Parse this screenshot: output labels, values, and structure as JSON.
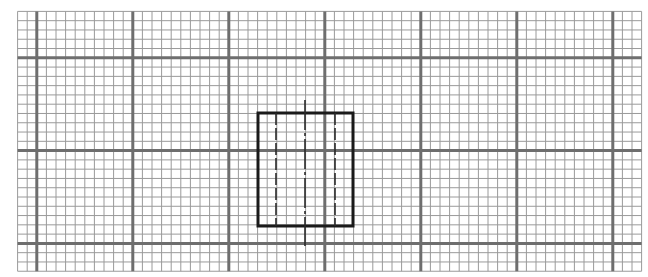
{
  "diagram": {
    "type": "orthographic-view-on-grid-paper",
    "grid": {
      "left": 17.6,
      "top": 11.4,
      "cols": 65,
      "rows": 28,
      "cell_w": 9.6,
      "cell_h": 9.28,
      "major_every_cols": 10,
      "major_col_offset": 2,
      "major_every_rows": 10,
      "major_row_offset": 5,
      "minor_color": "#9a9a9a",
      "major_color": "#6e6e6e",
      "minor_width": 1,
      "major_width": 3
    },
    "shape": {
      "rect": {
        "x": 258,
        "y": 113,
        "w": 95,
        "h": 113,
        "stroke": "#1a1a1a",
        "stroke_width": 3
      },
      "hidden_lines": [
        {
          "x": 276,
          "y1": 113,
          "y2": 226
        },
        {
          "x": 335,
          "y1": 113,
          "y2": 226
        }
      ],
      "hidden_dash": "12 3",
      "center_line": {
        "x": 305,
        "y1": 100,
        "y2": 246,
        "dash": "30 3 3 3"
      },
      "line_color": "#2a2a2a"
    }
  }
}
